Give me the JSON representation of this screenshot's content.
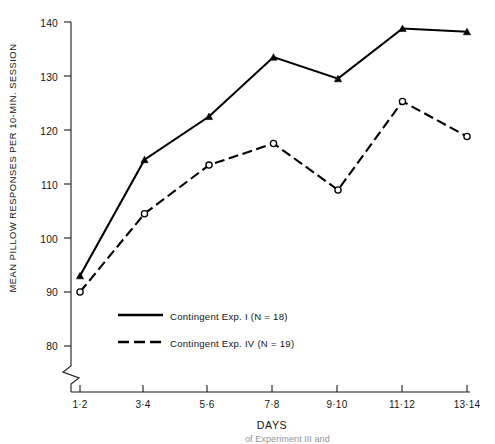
{
  "chart_data": {
    "type": "line",
    "title": "",
    "xlabel": "DAYS",
    "ylabel": "MEAN PILLOW RESPONSES PER 10-MIN. SESSION",
    "categories": [
      "1·2",
      "3·4",
      "5·6",
      "7·8",
      "9·10",
      "11·12",
      "13·14"
    ],
    "ytick_labels": [
      "140",
      "130",
      "120",
      "110",
      "100",
      "90",
      "80"
    ],
    "yticks": [
      140,
      130,
      120,
      110,
      100,
      90,
      80
    ],
    "ylim": [
      80,
      140
    ],
    "axis_break": true,
    "grid": false,
    "legend_position": "lower-left-inside",
    "series": [
      {
        "name": "Contingent Exp. I (N = 18)",
        "legend_label": "Contingent Exp. I (N = 18)",
        "line_style": "solid",
        "marker": "filled-triangle",
        "color": "#000000",
        "values": [
          93,
          114.5,
          122.5,
          133.5,
          129.5,
          138.8,
          138.2
        ]
      },
      {
        "name": "Contingent Exp. IV (N = 19)",
        "legend_label": "Contingent Exp. IV (N = 19)",
        "line_style": "dashed",
        "marker": "open-circle",
        "color": "#000000",
        "values": [
          90,
          104.5,
          113.5,
          117.5,
          108.9,
          125.3,
          118.8
        ]
      }
    ]
  },
  "axis": {
    "x_title": "DAYS"
  },
  "legend": {
    "entries": [
      {
        "label": "Contingent Exp. I (N = 18)",
        "style": "solid"
      },
      {
        "label": "Contingent Exp. IV (N = 19)",
        "style": "dashed"
      }
    ]
  },
  "caption": {
    "text": "of Experiment III and"
  }
}
